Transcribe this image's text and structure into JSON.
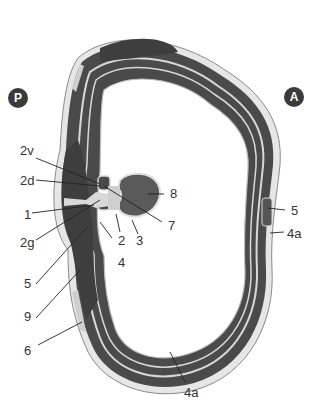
{
  "diagram": {
    "type": "anatomical cross-section (axial) of trunk wall",
    "colors": {
      "muscle": "#4a4a4a",
      "fascia": "#d8d8d8",
      "outline": "#8a8a8a",
      "badge": "#3a3a3a",
      "label": "#333333"
    },
    "orientation_badges": [
      {
        "id": "posterior",
        "text": "P"
      },
      {
        "id": "anterior",
        "text": "A"
      }
    ],
    "labels": [
      {
        "id": "2v",
        "text": "2v"
      },
      {
        "id": "2d",
        "text": "2d"
      },
      {
        "id": "1",
        "text": "1"
      },
      {
        "id": "2g",
        "text": "2g"
      },
      {
        "id": "5-left",
        "text": "5"
      },
      {
        "id": "9",
        "text": "9"
      },
      {
        "id": "6",
        "text": "6"
      },
      {
        "id": "2",
        "text": "2"
      },
      {
        "id": "3",
        "text": "3"
      },
      {
        "id": "4",
        "text": "4"
      },
      {
        "id": "8",
        "text": "8"
      },
      {
        "id": "7",
        "text": "7"
      },
      {
        "id": "5-right",
        "text": "5"
      },
      {
        "id": "4a-right",
        "text": "4a"
      },
      {
        "id": "4a-bottom",
        "text": "4a"
      }
    ]
  }
}
